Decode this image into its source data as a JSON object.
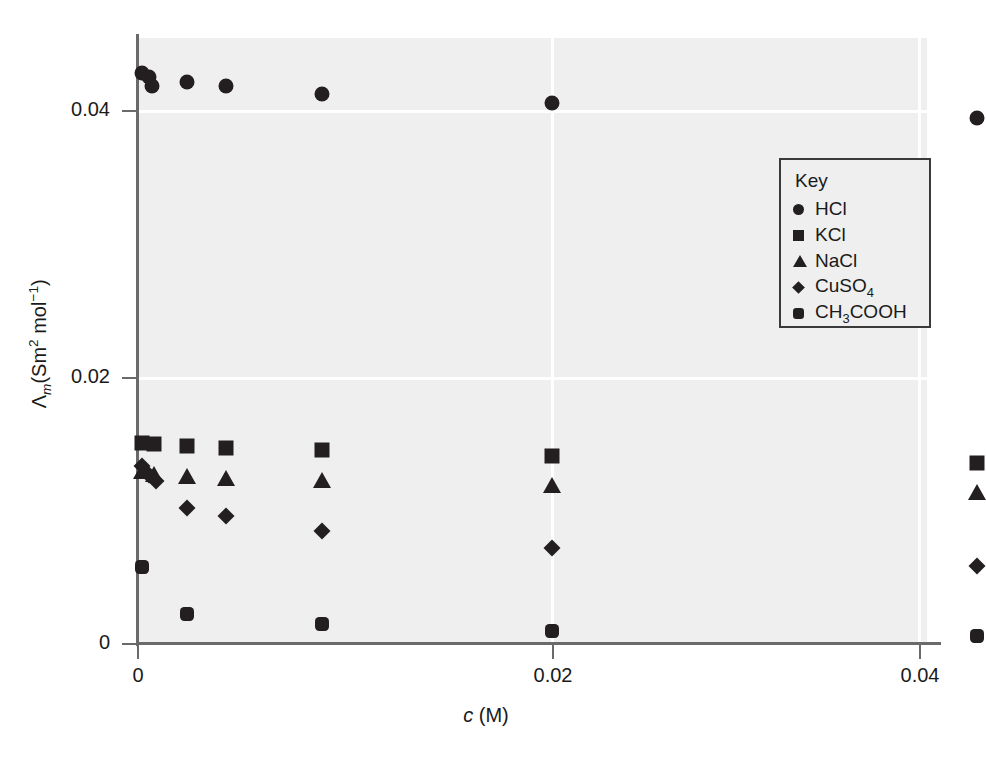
{
  "chart_data": {
    "type": "scatter",
    "title": "",
    "xlabel": "c (M)",
    "ylabel": "Λm(Sm2 mol−1)",
    "xlim": [
      0,
      0.0428
    ],
    "ylim": [
      0,
      0.0455
    ],
    "xticks": [
      0,
      0.02,
      0.04
    ],
    "xticklabels": [
      "0",
      "0.02",
      "0.04"
    ],
    "yticks": [
      0,
      0.02,
      0.04
    ],
    "yticklabels": [
      "0",
      "0.02",
      "0.04"
    ],
    "grid": "white gridlines on light-gray panel",
    "legend_position": "upper right inside axes",
    "series": [
      {
        "name": "HCl",
        "marker": "circle",
        "points": [
          {
            "x": 0.00025,
            "y": 0.0428
          },
          {
            "x": 0.0006,
            "y": 0.0425
          },
          {
            "x": 0.0007,
            "y": 0.0418
          },
          {
            "x": 0.0024,
            "y": 0.0421
          },
          {
            "x": 0.0043,
            "y": 0.0418
          },
          {
            "x": 0.0089,
            "y": 0.0412
          },
          {
            "x": 0.02,
            "y": 0.0405
          },
          {
            "x": 0.0405,
            "y": 0.0394
          }
        ]
      },
      {
        "name": "KCl",
        "marker": "square",
        "points": [
          {
            "x": 0.00025,
            "y": 0.015
          },
          {
            "x": 0.0008,
            "y": 0.01495
          },
          {
            "x": 0.0024,
            "y": 0.01475
          },
          {
            "x": 0.0043,
            "y": 0.0146
          },
          {
            "x": 0.0089,
            "y": 0.01445
          },
          {
            "x": 0.02,
            "y": 0.014
          },
          {
            "x": 0.0405,
            "y": 0.0135
          }
        ]
      },
      {
        "name": "NaCl",
        "marker": "triangle",
        "points": [
          {
            "x": 0.00025,
            "y": 0.0129
          },
          {
            "x": 0.0008,
            "y": 0.0127
          },
          {
            "x": 0.0024,
            "y": 0.0125
          },
          {
            "x": 0.0043,
            "y": 0.0124
          },
          {
            "x": 0.0089,
            "y": 0.01225
          },
          {
            "x": 0.02,
            "y": 0.01185
          },
          {
            "x": 0.0405,
            "y": 0.0113
          }
        ]
      },
      {
        "name": "CuSO4",
        "marker": "diamond",
        "points": [
          {
            "x": 0.00025,
            "y": 0.0133
          },
          {
            "x": 0.0006,
            "y": 0.0126
          },
          {
            "x": 0.0009,
            "y": 0.01215
          },
          {
            "x": 0.0024,
            "y": 0.0101
          },
          {
            "x": 0.0043,
            "y": 0.0095
          },
          {
            "x": 0.0089,
            "y": 0.0084
          },
          {
            "x": 0.02,
            "y": 0.0071
          },
          {
            "x": 0.0405,
            "y": 0.0058
          }
        ]
      },
      {
        "name": "CH3COOH",
        "marker": "hexagon",
        "points": [
          {
            "x": 0.00025,
            "y": 0.0057
          },
          {
            "x": 0.0024,
            "y": 0.0022
          },
          {
            "x": 0.0089,
            "y": 0.00145
          },
          {
            "x": 0.02,
            "y": 0.0009
          },
          {
            "x": 0.0405,
            "y": 0.00055
          }
        ]
      }
    ]
  },
  "axes": {
    "y_title_parts": {
      "lambda": "Λ",
      "sub_m": "m",
      "open": "(Sm",
      "sup2": "2",
      "mol": " mol",
      "sup_neg1": "−1",
      "close": ")"
    },
    "x_title_parts": {
      "c": "c",
      "unit": " (M)"
    },
    "y_ticklabels": [
      "0.04",
      "0.02",
      "0"
    ],
    "x_ticklabels": [
      "0",
      "0.02",
      "0.04"
    ]
  },
  "legend": {
    "title": "Key",
    "items": [
      {
        "label": "HCl",
        "marker": "circle"
      },
      {
        "label": "KCl",
        "marker": "square"
      },
      {
        "label": "NaCl",
        "marker": "triangle"
      },
      {
        "label_pre": "CuSO",
        "label_sub": "4",
        "marker": "diamond"
      },
      {
        "label_pre": "CH",
        "label_sub": "3",
        "label_post": "COOH",
        "marker": "hexagon"
      }
    ]
  }
}
